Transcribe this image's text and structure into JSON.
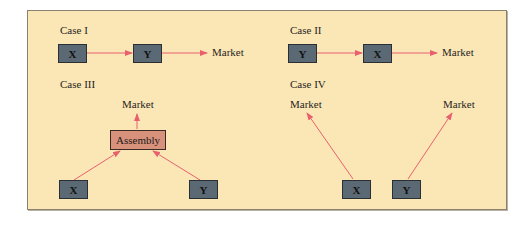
{
  "colors": {
    "panel": "#fbe7b5",
    "box": "#5b6975",
    "assembly": "#d8917a",
    "arrow": "#e8606e"
  },
  "cases": [
    {
      "title": "Case I",
      "nodes": [
        "X",
        "Y"
      ],
      "market": "Market"
    },
    {
      "title": "Case II",
      "nodes": [
        "Y",
        "X"
      ],
      "market": "Market"
    },
    {
      "title": "Case III",
      "nodes": [
        "X",
        "Y"
      ],
      "assembly": "Assembly",
      "market": "Market"
    },
    {
      "title": "Case IV",
      "nodes": [
        "X",
        "Y"
      ],
      "market_left": "Market",
      "market_right": "Market"
    }
  ]
}
